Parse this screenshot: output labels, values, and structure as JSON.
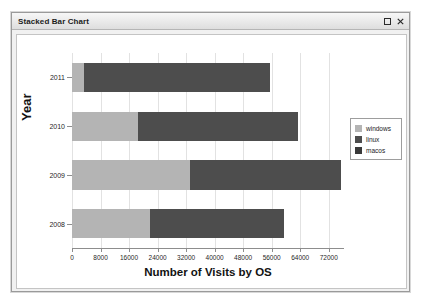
{
  "window": {
    "title": "Stacked Bar Chart",
    "maximize_label": "Maximize",
    "close_label": "Close"
  },
  "chart_data": {
    "type": "bar",
    "orientation": "horizontal",
    "stacked": true,
    "title": "",
    "xlabel": "Number of Visits by OS",
    "ylabel": "Year",
    "categories": [
      "2011",
      "2010",
      "2009",
      "2008"
    ],
    "xticks": [
      0,
      8000,
      16000,
      24000,
      32000,
      40000,
      48000,
      56000,
      64000,
      72000
    ],
    "xtick_labels": [
      "0",
      "8000",
      "16000",
      "24000",
      "32000",
      "40000",
      "48000",
      "56000",
      "64000",
      "72000"
    ],
    "xlim": [
      0,
      76000
    ],
    "grid": true,
    "legend_position": "right",
    "series": [
      {
        "name": "windows",
        "color": "#b4b4b4",
        "values": [
          3500,
          18500,
          33000,
          22000
        ]
      },
      {
        "name": "linux",
        "color": "#4d4d4d",
        "values": [
          52000,
          45000,
          42500,
          37500
        ]
      },
      {
        "name": "macos",
        "color": "#3a3a3a",
        "values": [
          0,
          0,
          0,
          0
        ]
      }
    ],
    "totals": [
      55500,
      63500,
      75500,
      59500
    ]
  },
  "legend": {
    "entries": [
      {
        "label": "windows"
      },
      {
        "label": "linux"
      },
      {
        "label": "macos"
      }
    ]
  }
}
